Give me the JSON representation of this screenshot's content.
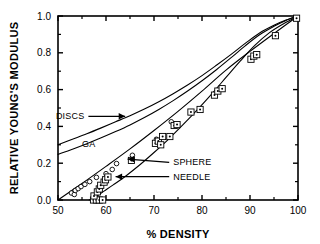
{
  "chart_data": {
    "type": "scatter",
    "title": "",
    "xlabel": "% DENSITY",
    "ylabel": "RELATIVE YOUNG'S MODULUS",
    "xlim": [
      50,
      100
    ],
    "ylim": [
      0.0,
      1.0
    ],
    "grid": false,
    "legend_position": "inline-annotations",
    "xticks": [
      50,
      60,
      70,
      80,
      90,
      100
    ],
    "xtick_labels": [
      "50",
      "60",
      "70",
      "80",
      "90",
      "100"
    ],
    "x_minor_ticks": [
      55,
      65,
      75,
      85,
      95
    ],
    "yticks": [
      0.0,
      0.2,
      0.4,
      0.6,
      0.8,
      1.0
    ],
    "ytick_labels": [
      "0.0",
      "0.2",
      "0.4",
      "0.6",
      "0.8",
      "1.0"
    ],
    "y_minor_ticks": [
      0.1,
      0.3,
      0.5,
      0.7,
      0.9
    ],
    "annotations": [
      {
        "text": "DISCS",
        "x": 55.5,
        "y": 0.455,
        "arrow": "right",
        "arrow_to_x": 64.0,
        "arrow_to_y": 0.455
      },
      {
        "text": "GA",
        "x": 55.0,
        "y": 0.305,
        "arrow": "none"
      },
      {
        "text": "SPHERE",
        "x": 74.0,
        "y": 0.205,
        "arrow": "left",
        "arrow_to_x": 64.5,
        "arrow_to_y": 0.222
      },
      {
        "text": "NEEDLE",
        "x": 74.0,
        "y": 0.127,
        "arrow": "left",
        "arrow_to_x": 62.0,
        "arrow_to_y": 0.127
      }
    ],
    "series": [
      {
        "name": "DISCS",
        "type": "line",
        "points": [
          [
            50.0,
            0.3
          ],
          [
            53.0,
            0.33
          ],
          [
            56.0,
            0.36
          ],
          [
            59.0,
            0.392
          ],
          [
            62.0,
            0.425
          ],
          [
            65.0,
            0.458
          ],
          [
            68.0,
            0.494
          ],
          [
            71.0,
            0.534
          ],
          [
            74.0,
            0.578
          ],
          [
            77.0,
            0.625
          ],
          [
            80.0,
            0.676
          ],
          [
            83.0,
            0.732
          ],
          [
            86.0,
            0.79
          ],
          [
            89.0,
            0.851
          ],
          [
            92.0,
            0.908
          ],
          [
            95.0,
            0.95
          ],
          [
            97.5,
            0.978
          ],
          [
            100.0,
            1.0
          ]
        ]
      },
      {
        "name": "GA",
        "type": "line",
        "points": [
          [
            50.0,
            0.248
          ],
          [
            53.0,
            0.276
          ],
          [
            56.0,
            0.306
          ],
          [
            59.0,
            0.338
          ],
          [
            62.0,
            0.372
          ],
          [
            65.0,
            0.408
          ],
          [
            68.0,
            0.448
          ],
          [
            71.0,
            0.492
          ],
          [
            74.0,
            0.54
          ],
          [
            77.0,
            0.592
          ],
          [
            80.0,
            0.648
          ],
          [
            83.0,
            0.708
          ],
          [
            86.0,
            0.772
          ],
          [
            89.0,
            0.838
          ],
          [
            92.0,
            0.898
          ],
          [
            95.0,
            0.944
          ],
          [
            97.5,
            0.976
          ],
          [
            100.0,
            1.0
          ]
        ]
      },
      {
        "name": "SPHERE",
        "type": "line",
        "points": [
          [
            50.0,
            0.0
          ],
          [
            55.0,
            0.09
          ],
          [
            60.0,
            0.183
          ],
          [
            65.0,
            0.278
          ],
          [
            70.0,
            0.378
          ],
          [
            75.0,
            0.482
          ],
          [
            80.0,
            0.592
          ],
          [
            85.0,
            0.706
          ],
          [
            90.0,
            0.808
          ],
          [
            95.0,
            0.905
          ],
          [
            100.0,
            1.0
          ]
        ]
      },
      {
        "name": "NEEDLE",
        "type": "line",
        "points": [
          [
            56.5,
            0.0
          ],
          [
            58.0,
            0.02
          ],
          [
            59.5,
            0.047
          ],
          [
            61.5,
            0.082
          ],
          [
            64.0,
            0.128
          ],
          [
            67.0,
            0.19
          ],
          [
            70.0,
            0.258
          ],
          [
            73.0,
            0.33
          ],
          [
            76.0,
            0.408
          ],
          [
            79.0,
            0.49
          ],
          [
            82.0,
            0.576
          ],
          [
            85.0,
            0.666
          ],
          [
            88.0,
            0.756
          ],
          [
            91.0,
            0.84
          ],
          [
            94.0,
            0.908
          ],
          [
            97.0,
            0.958
          ],
          [
            100.0,
            1.0
          ]
        ]
      },
      {
        "name": "circle data",
        "type": "scatter",
        "marker": "open-circle",
        "points": [
          [
            52.8,
            0.038
          ],
          [
            53.4,
            0.03
          ],
          [
            53.6,
            0.052
          ],
          [
            54.2,
            0.062
          ],
          [
            54.8,
            0.073
          ],
          [
            55.6,
            0.085
          ],
          [
            56.6,
            0.1
          ],
          [
            58.0,
            0.123
          ],
          [
            60.0,
            0.143
          ],
          [
            61.3,
            0.166
          ],
          [
            62.2,
            0.198
          ],
          [
            65.5,
            0.243
          ],
          [
            70.5,
            0.33
          ],
          [
            73.6,
            0.425
          ]
        ]
      },
      {
        "name": "square data",
        "type": "scatter",
        "marker": "open-square-dot",
        "points": [
          [
            57.4,
            0.0
          ],
          [
            58.0,
            0.0
          ],
          [
            58.6,
            0.0
          ],
          [
            59.3,
            0.0
          ],
          [
            57.5,
            0.022
          ],
          [
            58.2,
            0.044
          ],
          [
            58.6,
            0.06
          ],
          [
            58.9,
            0.08
          ],
          [
            59.6,
            0.097
          ],
          [
            59.9,
            0.11
          ],
          [
            60.4,
            0.125
          ],
          [
            65.3,
            0.215
          ],
          [
            70.3,
            0.308
          ],
          [
            70.9,
            0.32
          ],
          [
            71.4,
            0.3
          ],
          [
            71.8,
            0.345
          ],
          [
            73.3,
            0.345
          ],
          [
            74.2,
            0.405
          ],
          [
            74.8,
            0.41
          ],
          [
            77.7,
            0.478
          ],
          [
            79.6,
            0.492
          ],
          [
            82.6,
            0.57
          ],
          [
            83.3,
            0.592
          ],
          [
            84.2,
            0.605
          ],
          [
            90.2,
            0.765
          ],
          [
            90.8,
            0.782
          ],
          [
            91.4,
            0.79
          ],
          [
            95.3,
            0.893
          ],
          [
            99.7,
            0.988
          ]
        ]
      }
    ]
  }
}
